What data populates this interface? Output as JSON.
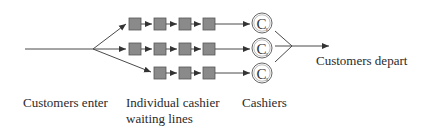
{
  "diagram": {
    "type": "single-stage multi-channel queue",
    "colors": {
      "line": "#4a4a4a",
      "customer_fill": "#8a8a8a",
      "customer_stroke": "#555555",
      "cashier_stroke": "#555555"
    },
    "entry_label": "Customers enter",
    "queue_label_line1": "Individual cashier",
    "queue_label_line2": "waiting lines",
    "cashiers_label": "Cashiers",
    "exit_label": "Customers depart",
    "cashier_symbol": "C",
    "lines": [
      {
        "id": 1,
        "customers_waiting": 4,
        "cashier": "C1"
      },
      {
        "id": 2,
        "customers_waiting": 4,
        "cashier": "C2"
      },
      {
        "id": 3,
        "customers_waiting": 3,
        "cashier": "C3"
      }
    ]
  }
}
